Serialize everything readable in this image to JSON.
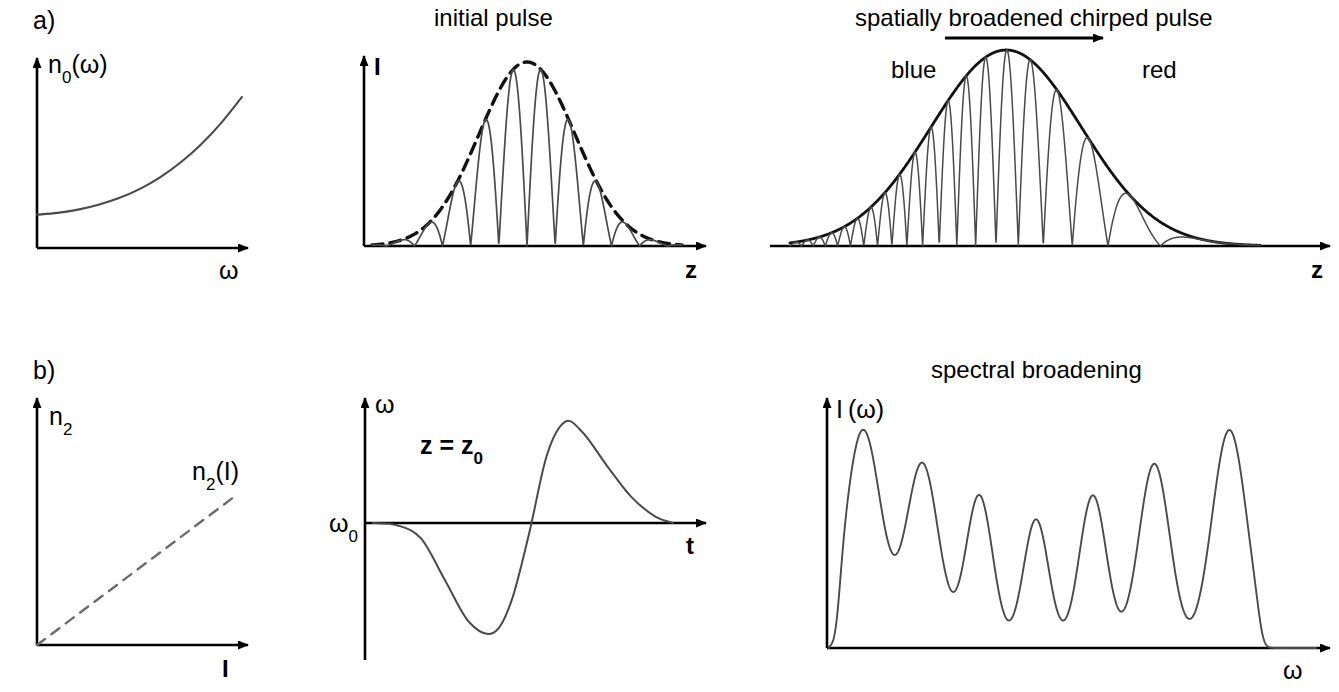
{
  "figure": {
    "width": 1339,
    "height": 692,
    "background": "#ffffff",
    "stroke_color": "#000000",
    "curve_color": "#4a4a4a",
    "panel_labels": [
      {
        "id": "a",
        "text": "a)",
        "x": 33,
        "y": 8
      },
      {
        "id": "b",
        "text": "b)",
        "x": 33,
        "y": 358
      }
    ]
  },
  "panels": {
    "dispersion": {
      "name": "linear refractive index dispersion",
      "y_axis_label": "n",
      "y_axis_label_sub": "0",
      "y_axis_label_suffix": "(ω)",
      "x_axis_label": "ω",
      "title": ""
    },
    "initial_pulse": {
      "name": "initial pulse",
      "title": "initial pulse",
      "y_axis_label": "I",
      "x_axis_label": "z"
    },
    "chirped_pulse": {
      "name": "spatially broadened chirped pulse",
      "title": "spatially broadened chirped pulse",
      "arrow_annotation": "propagation-direction-arrow",
      "blue_label": "blue",
      "red_label": "red",
      "x_axis_label": "z"
    },
    "nonlinear_index": {
      "name": "intensity dependent index",
      "y_axis_label": "n",
      "y_axis_label_sub": "2",
      "x_axis_label": "I",
      "curve_label": "n",
      "curve_label_sub": "2",
      "curve_label_suffix": "(I)"
    },
    "chirp": {
      "name": "instantaneous frequency chirp",
      "y_axis_label": "ω",
      "y_axis_origin_label": "ω",
      "y_axis_origin_sub": "0",
      "x_axis_label": "t",
      "annotation": "z = z",
      "annotation_sub": "0"
    },
    "spectrum": {
      "name": "spectral broadening",
      "title": "spectral broadening",
      "y_axis_label": "I (ω)",
      "x_axis_label": "ω"
    }
  },
  "chart_data": [
    {
      "id": "dispersion",
      "type": "line",
      "title": "",
      "xlabel": "ω",
      "ylabel": "n₀(ω)",
      "grid": false,
      "legend": "none",
      "axes": {
        "ox": 37,
        "oy": 248,
        "x_end": 248,
        "y_top": 58
      },
      "description": "normal dispersion: refractive index rises monotonically with frequency",
      "x": [
        0.0,
        0.1,
        0.2,
        0.3,
        0.4,
        0.5,
        0.6,
        0.7,
        0.8,
        0.9,
        1.0
      ],
      "y": [
        0.175,
        0.185,
        0.202,
        0.228,
        0.263,
        0.31,
        0.372,
        0.45,
        0.545,
        0.66,
        0.795
      ],
      "xlim": [
        0,
        1
      ],
      "ylim": [
        0,
        1
      ]
    },
    {
      "id": "initial_pulse",
      "type": "line",
      "title": "initial pulse",
      "xlabel": "z",
      "ylabel": "I",
      "grid": false,
      "legend": "none",
      "axes": {
        "ox": 364,
        "oy": 246,
        "x_end": 706,
        "y_top": 56
      },
      "description": "transform limited pulse: dashed gaussian envelope with constant-frequency rectified carrier",
      "envelope": {
        "style": "dashed",
        "peak": 1.0,
        "center": 0.5,
        "sigma": 0.155
      },
      "carrier": {
        "style": "solid",
        "cycles": 11,
        "chirp": 0.0
      },
      "xlim": [
        0,
        1
      ],
      "ylim": [
        0,
        1
      ]
    },
    {
      "id": "chirped_pulse",
      "type": "line",
      "title": "spatially broadened chirped pulse",
      "xlabel": "z",
      "ylabel": "",
      "grid": false,
      "legend": "none",
      "axes": {
        "ox": 770,
        "oy": 246,
        "x_end": 1330,
        "y_top": 42
      },
      "description": "chirped pulse: solid gaussian envelope, carrier frequency decreasing from blue (left) to red (right)",
      "envelope": {
        "style": "solid",
        "peak": 1.0,
        "center": 0.46,
        "sigma": 0.16
      },
      "carrier": {
        "style": "solid",
        "cycles": 14,
        "chirp": 3.2
      },
      "annotations": [
        {
          "label": "blue",
          "x": 0.24
        },
        {
          "label": "red",
          "x": 0.78
        }
      ],
      "xlim": [
        0,
        1
      ],
      "ylim": [
        0,
        1
      ]
    },
    {
      "id": "nonlinear_index",
      "type": "line",
      "title": "",
      "xlabel": "I",
      "ylabel": "n₂",
      "grid": false,
      "legend": "none",
      "axes": {
        "ox": 37,
        "oy": 645,
        "x_end": 248,
        "y_top": 398
      },
      "description": "optical Kerr effect: nonlinear index grows linearly with intensity",
      "style": "dashed",
      "x": [
        0.0,
        1.0
      ],
      "y": [
        0.0,
        0.62
      ],
      "xlim": [
        0,
        1
      ],
      "ylim": [
        0,
        1
      ]
    },
    {
      "id": "chirp",
      "type": "line",
      "title": "",
      "xlabel": "t",
      "ylabel": "ω",
      "grid": false,
      "legend": "none",
      "axes": {
        "ox": 365,
        "oy": 523,
        "x_end": 706,
        "y_top": 398,
        "y_bottom": 660
      },
      "description": "self phase modulation chirp at z = z0: negative frequency shift on leading edge, positive on trailing edge",
      "baseline_label": "ω₀",
      "x": [
        0.0,
        0.08,
        0.16,
        0.24,
        0.32,
        0.4,
        0.46,
        0.52,
        0.58,
        0.64,
        0.7,
        0.78,
        0.86,
        0.94,
        1.0
      ],
      "y": [
        0.0,
        -0.02,
        -0.14,
        -0.52,
        -0.9,
        -1.0,
        -0.72,
        -0.1,
        0.62,
        0.92,
        0.82,
        0.52,
        0.24,
        0.06,
        0.0
      ],
      "xlim": [
        0,
        1
      ],
      "ylim": [
        -1,
        1
      ]
    },
    {
      "id": "spectrum",
      "type": "line",
      "title": "spectral broadening",
      "xlabel": "ω",
      "ylabel": "I (ω)",
      "grid": false,
      "legend": "none",
      "axes": {
        "ox": 827,
        "oy": 648,
        "x_end": 1330,
        "y_top": 398
      },
      "description": "self phase modulated spectrum: seven modulation peaks, strongest at the outer edges",
      "peaks": [
        {
          "center": 0.075,
          "height": 1.0,
          "width": 0.04
        },
        {
          "center": 0.205,
          "height": 0.845,
          "width": 0.036
        },
        {
          "center": 0.33,
          "height": 0.7,
          "width": 0.03
        },
        {
          "center": 0.455,
          "height": 0.59,
          "width": 0.028
        },
        {
          "center": 0.58,
          "height": 0.7,
          "width": 0.03
        },
        {
          "center": 0.715,
          "height": 0.845,
          "width": 0.034
        },
        {
          "center": 0.88,
          "height": 1.0,
          "width": 0.038
        }
      ],
      "span": [
        0.02,
        0.95
      ],
      "xlim": [
        0,
        1
      ],
      "ylim": [
        0,
        1
      ]
    }
  ]
}
